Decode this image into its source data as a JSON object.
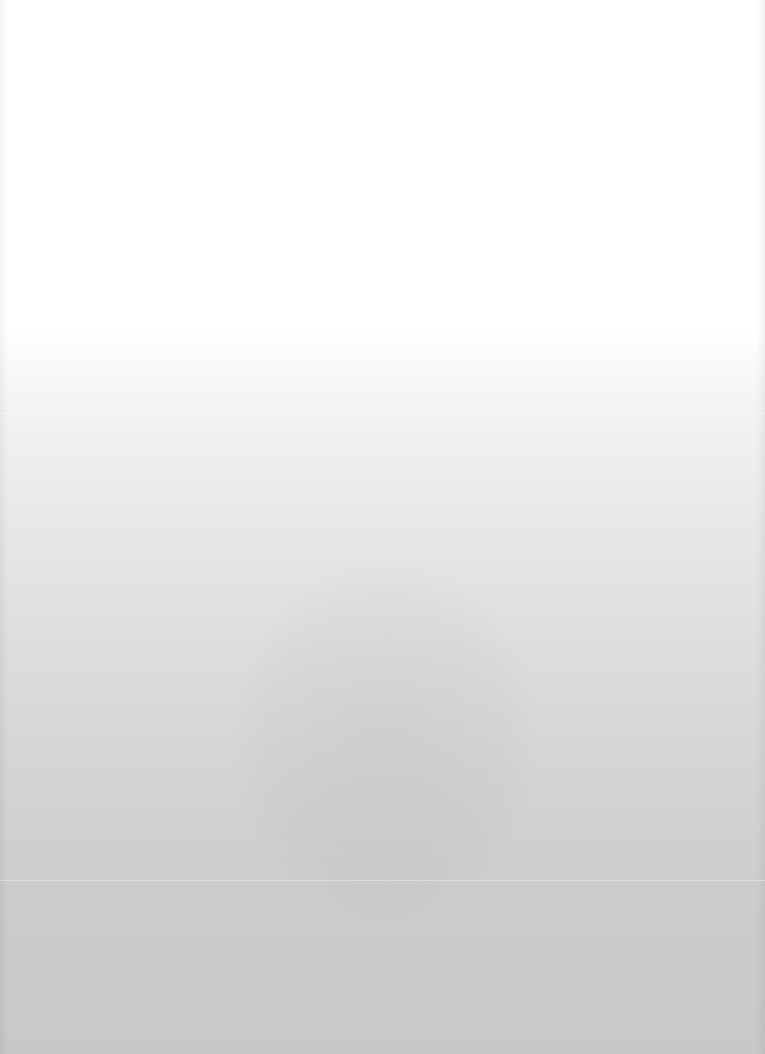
{
  "page": {
    "background_top_color": "#ffffff",
    "background_bottom_color": "#c8c8c8",
    "text": ""
  }
}
